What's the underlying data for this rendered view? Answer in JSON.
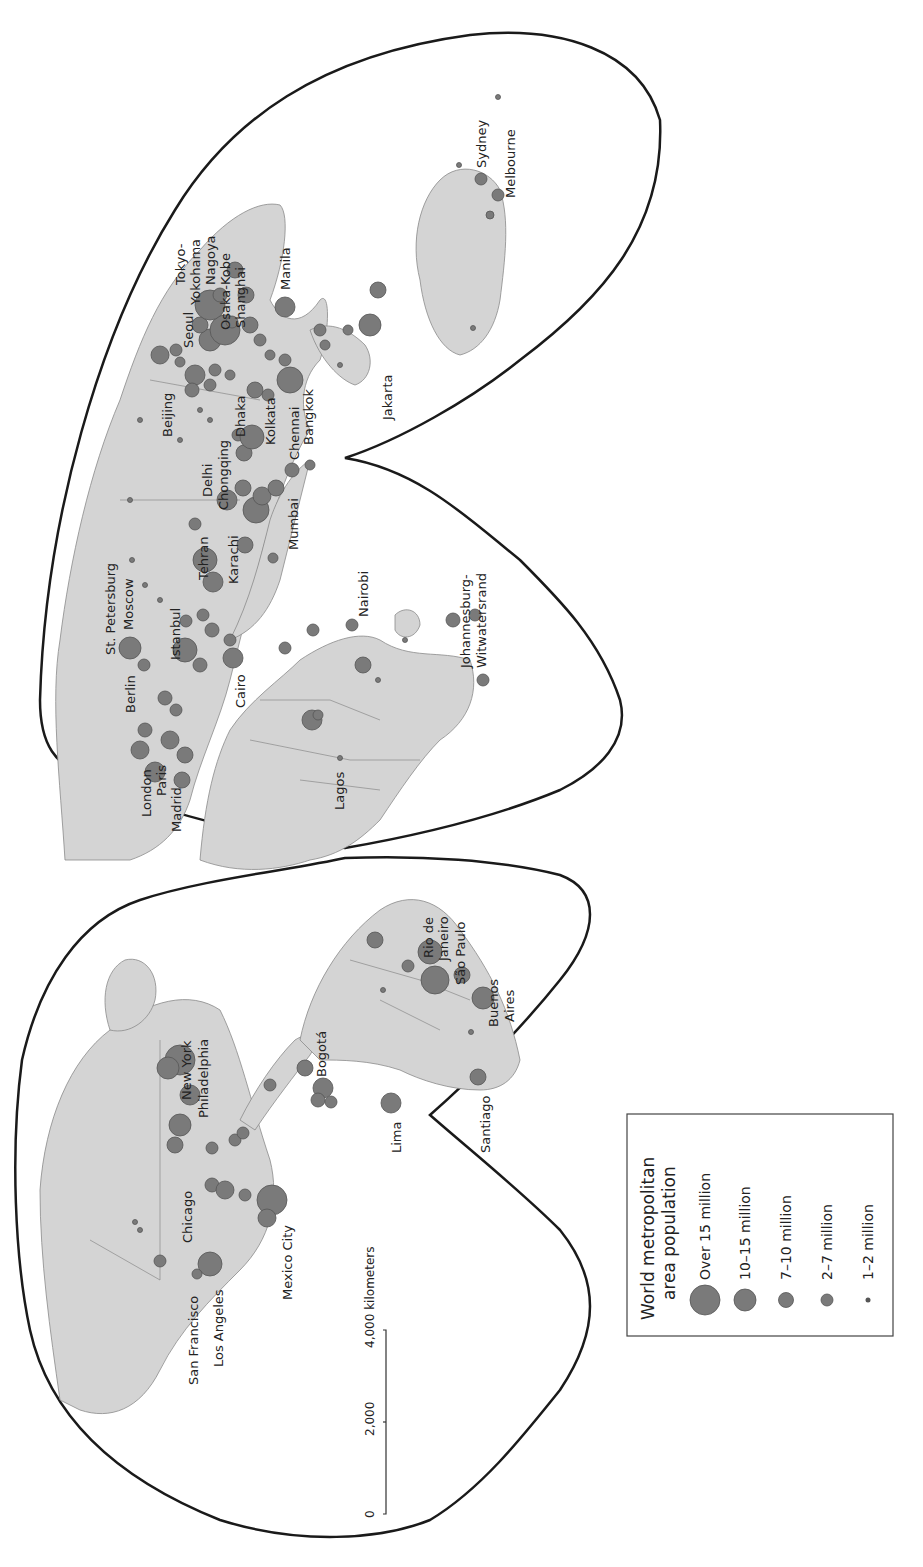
{
  "map": {
    "projection_note": "Interrupted world map, rotated 90° counterclockwise",
    "colors": {
      "land": "#d4d4d4",
      "border": "#8a8a8a",
      "city": "#7a7a7a",
      "city_stroke": "#555555",
      "outline": "#1a1a1a"
    },
    "legend": {
      "title_line1": "World metropolitan",
      "title_line2": "area population",
      "items": [
        {
          "label": "Over 15 million",
          "r": 15
        },
        {
          "label": "10–15 million",
          "r": 11
        },
        {
          "label": "7–10 million",
          "r": 7.5
        },
        {
          "label": "2–7 million",
          "r": 6
        },
        {
          "label": "1–2 million",
          "r": 2.5
        }
      ]
    },
    "scale_bar": {
      "ticks": [
        "0",
        "2,000",
        "4,000 kilometers"
      ]
    },
    "cities": [
      {
        "name": "San Francisco"
      },
      {
        "name": "Los Angeles"
      },
      {
        "name": "Chicago"
      },
      {
        "name": "Mexico City"
      },
      {
        "name": "New York"
      },
      {
        "name": "Philadelphia"
      },
      {
        "name": "Bogotá"
      },
      {
        "name": "Lima"
      },
      {
        "name": "Santiago"
      },
      {
        "name": "Rio de Janeiro"
      },
      {
        "name": "São Paulo"
      },
      {
        "name": "Buenos Aires"
      },
      {
        "name": "London"
      },
      {
        "name": "Paris"
      },
      {
        "name": "Madrid"
      },
      {
        "name": "Berlin"
      },
      {
        "name": "St. Petersburg"
      },
      {
        "name": "Moscow"
      },
      {
        "name": "Istanbul"
      },
      {
        "name": "Cairo"
      },
      {
        "name": "Lagos"
      },
      {
        "name": "Nairobi"
      },
      {
        "name": "Johannesburg-Witwatersrand"
      },
      {
        "name": "Tehran"
      },
      {
        "name": "Karachi"
      },
      {
        "name": "Mumbai"
      },
      {
        "name": "Delhi"
      },
      {
        "name": "Chongqing"
      },
      {
        "name": "Beijing"
      },
      {
        "name": "Dhaka"
      },
      {
        "name": "Kolkata"
      },
      {
        "name": "Chennai"
      },
      {
        "name": "Bangkok"
      },
      {
        "name": "Seoul"
      },
      {
        "name": "Shanghai"
      },
      {
        "name": "Osaka-Kobe"
      },
      {
        "name": "Nagoya"
      },
      {
        "name": "Tokyo-Yokohama"
      },
      {
        "name": "Manila"
      },
      {
        "name": "Jakarta"
      },
      {
        "name": "Sydney"
      },
      {
        "name": "Melbourne"
      }
    ]
  },
  "labels": {
    "sf": "San Francisco",
    "la": "Los Angeles",
    "chicago": "Chicago",
    "mexico": "Mexico City",
    "ny": "New York",
    "phil": "Philadelphia",
    "bogota": "Bogotá",
    "lima": "Lima",
    "santiago": "Santiago",
    "rio1": "Rio de",
    "rio2": "Janeiro",
    "saopaulo": "São Paulo",
    "ba1": "Buenos",
    "ba2": "Aires",
    "london": "London",
    "paris": "Paris",
    "madrid": "Madrid",
    "berlin": "Berlin",
    "stpete": "St. Petersburg",
    "moscow": "Moscow",
    "istanbul": "Istanbul",
    "cairo": "Cairo",
    "lagos": "Lagos",
    "nairobi": "Nairobi",
    "joburg1": "Johannesburg-",
    "joburg2": "Witwatersrand",
    "tehran": "Tehran",
    "karachi": "Karachi",
    "mumbai": "Mumbai",
    "delhi": "Delhi",
    "chongqing": "Chongqing",
    "beijing": "Beijing",
    "dhaka": "Dhaka",
    "kolkata": "Kolkata",
    "chennai": "Chennai",
    "bangkok": "Bangkok",
    "seoul": "Seoul",
    "shanghai": "Shanghai",
    "osaka": "Osaka-Kobe",
    "nagoya": "Nagoya",
    "tokyo1": "Tokyo-",
    "tokyo2": "Yokohama",
    "manila": "Manila",
    "jakarta": "Jakarta",
    "sydney": "Sydney",
    "melbourne": "Melbourne"
  }
}
